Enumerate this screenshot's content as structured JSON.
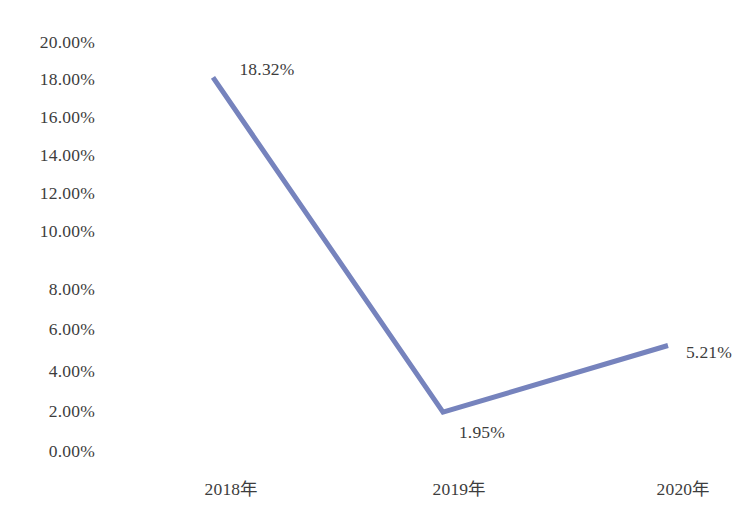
{
  "chart_data": {
    "type": "line",
    "title": "",
    "subtitle": "",
    "xlabel": "",
    "ylabel": "",
    "categories": [
      "2018年",
      "2019年",
      "2020年"
    ],
    "values": [
      18.32,
      1.95,
      5.21
    ],
    "value_labels": [
      "18.32%",
      "1.95%",
      "5.21%"
    ],
    "unit": "%",
    "ylim": [
      0,
      20
    ],
    "ytick_values": [
      20,
      18,
      16,
      14,
      12,
      10,
      8,
      6,
      4,
      2,
      0
    ],
    "ytick_labels": [
      "20.00%",
      "18.00%",
      "16.00%",
      "14.00%",
      "12.00%",
      "10.00%",
      "8.00%",
      "6.00%",
      "4.00%",
      "2.00%",
      "0.00%"
    ],
    "grid": false,
    "legend": false,
    "legend_position": "none",
    "series": [
      {
        "name": "",
        "values": [
          18.32,
          1.95,
          5.21
        ],
        "color": "#7683bd",
        "line_width": 5,
        "markers": false
      }
    ],
    "annotations": [
      {
        "text": "18.32%",
        "x": 267,
        "y": 70
      },
      {
        "text": "1.95%",
        "x": 482,
        "y": 433
      },
      {
        "text": "5.21%",
        "x": 709,
        "y": 353
      }
    ],
    "colors": {
      "line": "#7683bd",
      "background": "#ffffff",
      "text": "#3d3d3d"
    }
  },
  "geometry": {
    "ytick_y": [
      43,
      80,
      118,
      156,
      194,
      232,
      290,
      330,
      372,
      412,
      452
    ],
    "xtick": [
      {
        "label": "2018年",
        "x": 231,
        "y": 481
      },
      {
        "label": "2019年",
        "x": 459,
        "y": 481
      },
      {
        "label": "2020年",
        "x": 683,
        "y": 481
      }
    ],
    "points": [
      {
        "x": 213,
        "y": 77
      },
      {
        "x": 443,
        "y": 416
      },
      {
        "x": 668,
        "y": 352
      }
    ]
  }
}
